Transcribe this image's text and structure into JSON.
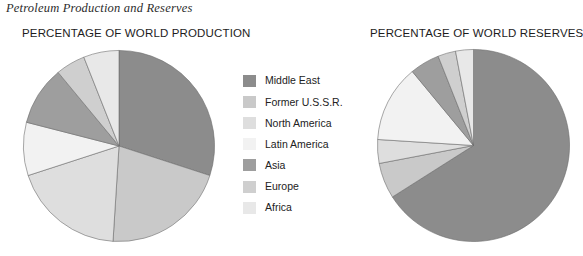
{
  "figure": {
    "caption": "Petroleum Production and Reserves"
  },
  "panels": [
    {
      "id": "production",
      "title": "PERCENTAGE OF WORLD PRODUCTION"
    },
    {
      "id": "reserves",
      "title": "PERCENTAGE OF WORLD RESERVES"
    }
  ],
  "legend": {
    "items": [
      {
        "label": "Middle East",
        "color": "#8c8c8c"
      },
      {
        "label": "Former U.S.S.R.",
        "color": "#c9c9c9"
      },
      {
        "label": "North America",
        "color": "#dedede"
      },
      {
        "label": "Latin America",
        "color": "#f2f2f2"
      },
      {
        "label": "Asia",
        "color": "#9e9e9e"
      },
      {
        "label": "Europe",
        "color": "#cfcfcf"
      },
      {
        "label": "Africa",
        "color": "#e8e8e8"
      }
    ]
  },
  "chart_data": [
    {
      "type": "pie",
      "title": "PERCENTAGE OF WORLD PRODUCTION",
      "categories": [
        "Middle East",
        "Former U.S.S.R.",
        "North America",
        "Latin America",
        "Asia",
        "Europe",
        "Africa"
      ],
      "values": [
        30,
        21,
        19,
        9,
        10,
        5,
        6
      ],
      "colors": [
        "#8c8c8c",
        "#c9c9c9",
        "#dedede",
        "#f2f2f2",
        "#9e9e9e",
        "#cfcfcf",
        "#e8e8e8"
      ],
      "units": "percent",
      "start_angle_deg": 0,
      "direction": "clockwise",
      "legend_position": "center"
    },
    {
      "type": "pie",
      "title": "PERCENTAGE OF WORLD RESERVES",
      "categories": [
        "Middle East",
        "Former U.S.S.R.",
        "North America",
        "Latin America",
        "Asia",
        "Europe",
        "Africa"
      ],
      "values": [
        66,
        6,
        4,
        13,
        5,
        3,
        3
      ],
      "colors": [
        "#8c8c8c",
        "#c9c9c9",
        "#dedede",
        "#f2f2f2",
        "#9e9e9e",
        "#cfcfcf",
        "#e8e8e8"
      ],
      "units": "percent",
      "start_angle_deg": 0,
      "direction": "clockwise",
      "legend_position": "center"
    }
  ]
}
